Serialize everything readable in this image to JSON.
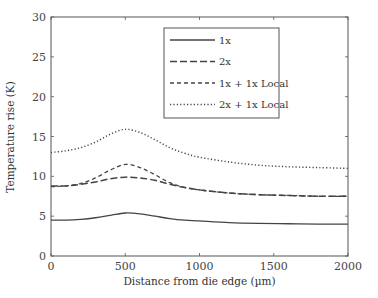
{
  "chart_data": {
    "type": "line",
    "title": "",
    "xlabel": "Distance from die edge (µm)",
    "ylabel": "Temperature rise (K)",
    "xlim": [
      0,
      2000
    ],
    "ylim": [
      0,
      30
    ],
    "xticks": [
      0,
      500,
      1000,
      1500,
      2000
    ],
    "yticks": [
      0,
      5,
      10,
      15,
      20,
      25,
      30
    ],
    "grid": false,
    "legend_position": "upper right (inside)",
    "x": [
      0,
      100,
      200,
      300,
      400,
      500,
      600,
      700,
      800,
      900,
      1000,
      1200,
      1400,
      1600,
      1800,
      2000
    ],
    "series": [
      {
        "name": "1x",
        "style": "solid",
        "values": [
          4.5,
          4.5,
          4.6,
          4.8,
          5.1,
          5.4,
          5.3,
          5.0,
          4.7,
          4.5,
          4.4,
          4.2,
          4.1,
          4.05,
          4.0,
          4.0
        ]
      },
      {
        "name": "2x",
        "style": "long-dash",
        "values": [
          8.8,
          8.8,
          9.0,
          9.3,
          9.7,
          9.9,
          9.8,
          9.5,
          9.0,
          8.6,
          8.3,
          7.9,
          7.7,
          7.6,
          7.5,
          7.5
        ]
      },
      {
        "name": "1x + 1x Local",
        "style": "short-dash",
        "values": [
          8.7,
          8.8,
          9.1,
          9.8,
          10.8,
          11.5,
          11.1,
          10.2,
          9.2,
          8.6,
          8.3,
          7.9,
          7.7,
          7.6,
          7.5,
          7.5
        ]
      },
      {
        "name": "2x + 1x Local",
        "style": "dotted",
        "values": [
          13.0,
          13.2,
          13.6,
          14.3,
          15.3,
          15.9,
          15.5,
          14.6,
          13.6,
          12.9,
          12.4,
          11.8,
          11.4,
          11.2,
          11.1,
          11.0
        ]
      }
    ]
  }
}
